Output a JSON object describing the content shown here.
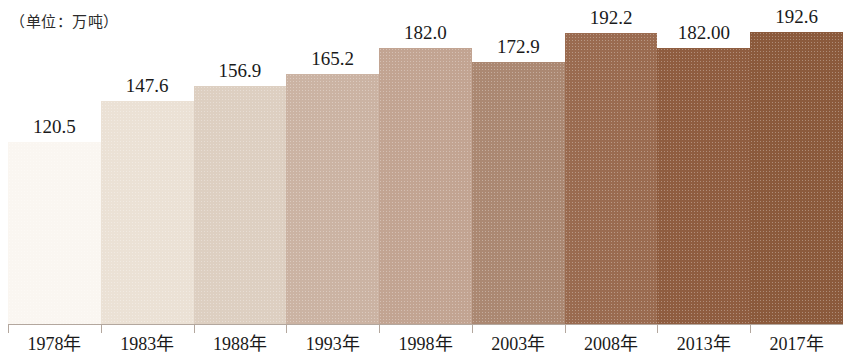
{
  "unit_caption": "（单位：万吨）",
  "chart_data": {
    "type": "bar",
    "title": "",
    "subtitle": "",
    "xlabel": "",
    "ylabel": "万吨",
    "unit_note": "（单位：万吨）",
    "grid": false,
    "legend": false,
    "legend_position": "none",
    "ylim": [
      0,
      214
    ],
    "categories": [
      "1978年",
      "1983年",
      "1988年",
      "1993年",
      "1998年",
      "2003年",
      "2008年",
      "2013年",
      "2017年"
    ],
    "values": [
      120.5,
      147.6,
      156.9,
      165.2,
      182.0,
      172.9,
      192.2,
      182.0,
      192.6
    ],
    "value_labels": [
      "120.5",
      "147.6",
      "156.9",
      "165.2",
      "182.0",
      "172.9",
      "192.2",
      "182.00",
      "192.6"
    ],
    "bar_colors": [
      "#faf6f1",
      "#ebe1d5",
      "#ddcfc1",
      "#cbb3a3",
      "#c2a492",
      "#ab8872",
      "#9a6b50",
      "#8f5d40",
      "#8b5a3c"
    ],
    "series": [
      {
        "name": "产量",
        "values": [
          120.5,
          147.6,
          156.9,
          165.2,
          182.0,
          172.9,
          192.2,
          182.0,
          192.6
        ]
      }
    ]
  }
}
